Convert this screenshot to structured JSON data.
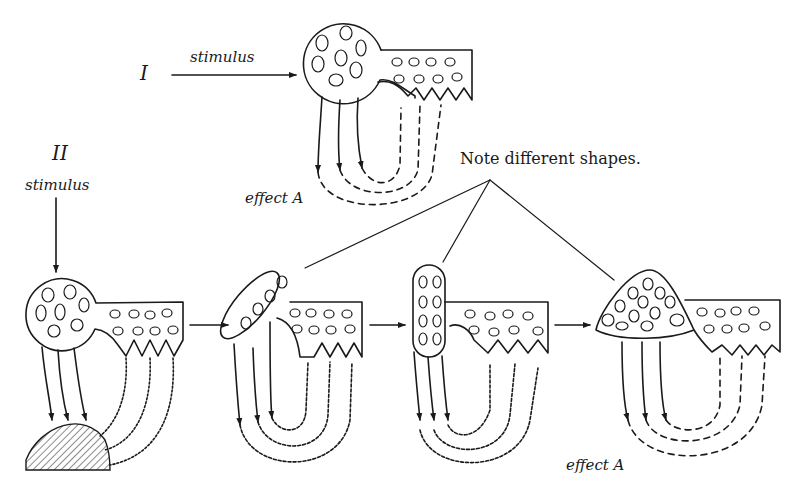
{
  "figure": {
    "part_one": {
      "numeral": "I",
      "stimulus_label": "stimulus",
      "effect_label": "effect A",
      "effector_line_style": "dashed"
    },
    "part_two": {
      "numeral": "II",
      "stimulus_label": "stimulus",
      "effect_label": "effect A",
      "stages": [
        {
          "cell_shape": "round",
          "effector_line_style": "wavy",
          "effect": "hatched-mound"
        },
        {
          "cell_shape": "elongated-oval",
          "effector_line_style": "wavy"
        },
        {
          "cell_shape": "upright-oval",
          "effector_line_style": "wavy"
        },
        {
          "cell_shape": "triangular",
          "effector_line_style": "dashed"
        }
      ]
    },
    "note": "Note different shapes."
  },
  "colors": {
    "ink": "#1a1a1a",
    "paper": "#ffffff"
  }
}
